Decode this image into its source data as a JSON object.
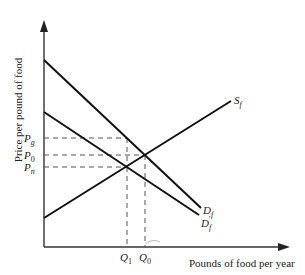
{
  "diagram": {
    "type": "supply-demand",
    "y_axis_label": "Price per pound of food",
    "x_axis_label": "Pounds of food per year",
    "price_labels": {
      "pg": {
        "main": "P",
        "sub": "g"
      },
      "p0": {
        "main": "P",
        "sub": "0"
      },
      "pn": {
        "main": "P",
        "sub": "n"
      }
    },
    "quantity_labels": {
      "q1": {
        "main": "Q",
        "sub": "1"
      },
      "q0": {
        "main": "Q",
        "sub": "0"
      }
    },
    "curves": {
      "supply": {
        "main": "S",
        "sub": "f"
      },
      "demand": {
        "main": "D",
        "sub": "f"
      },
      "demand_shifted": {
        "main": "D",
        "sub": "f",
        "prime": "′"
      }
    },
    "colors": {
      "line": "#111111",
      "dash": "#555555",
      "axis": "#333333"
    }
  }
}
